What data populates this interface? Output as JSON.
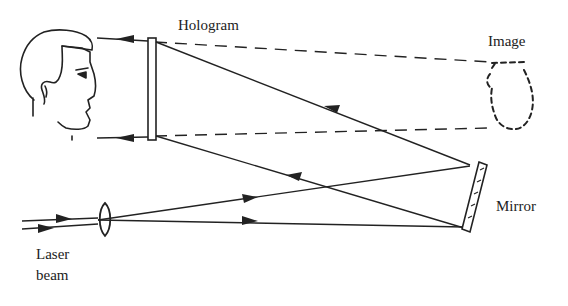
{
  "diagram": {
    "labels": {
      "hologram": "Hologram",
      "image": "Image",
      "mirror": "Mirror",
      "laser_line1": "Laser",
      "laser_line2": "beam"
    },
    "colors": {
      "ink": "#222222",
      "background": "#ffffff"
    },
    "components": [
      "viewer-head",
      "hologram-plate",
      "virtual-image-vase",
      "mirror",
      "lens",
      "laser-beam"
    ]
  }
}
